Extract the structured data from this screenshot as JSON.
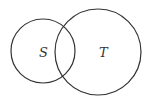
{
  "diagram": {
    "type": "venn",
    "sets": [
      {
        "label": "S",
        "cx": 43,
        "cy": 51,
        "r": 32
      },
      {
        "label": "T",
        "cx": 98,
        "cy": 52,
        "r": 43
      }
    ],
    "stroke_color": "#333333"
  }
}
